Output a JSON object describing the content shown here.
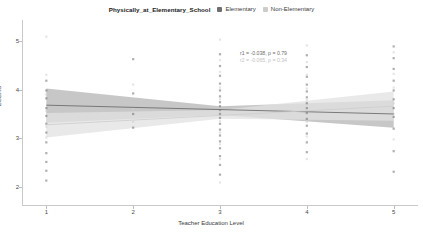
{
  "legend": {
    "title": "Physically_at_Elementary_School",
    "entries": [
      {
        "label": "Elementary",
        "color": "#6e6e6e",
        "marker": "square"
      },
      {
        "label": "Non-Elementary",
        "color": "#cccccc",
        "marker": "square"
      }
    ]
  },
  "annotations": {
    "elementary": "r1 = -0.038, p = 0.79",
    "non_elementary": "r2 = -0.065, p = 0.34"
  },
  "chart_data": {
    "type": "scatter",
    "title": "Physically_at_Elementary_School",
    "xlabel": "Teacher Education Level",
    "ylabel": "ECERS",
    "xlim": [
      0.72,
      5.28
    ],
    "ylim": [
      1.62,
      5.42
    ],
    "xticks": [
      1,
      2,
      3,
      4,
      5
    ],
    "xtick_labels": [
      "1",
      "2",
      "3",
      "4",
      "5"
    ],
    "yticks": [
      2,
      3,
      4,
      5
    ],
    "ytick_labels": [
      "2",
      "3",
      "4",
      "5"
    ],
    "grid": false,
    "legend_position": "top-center",
    "series": [
      {
        "name": "Elementary",
        "color": "#6e6e6e",
        "band_color": "#b4b4b4",
        "r": -0.038,
        "p": 0.79,
        "fit_line": {
          "x": [
            1,
            5
          ],
          "y": [
            3.68,
            3.5
          ]
        },
        "band": {
          "x": [
            1,
            3,
            5
          ],
          "upper": [
            4.02,
            3.66,
            3.78
          ],
          "lower": [
            3.32,
            3.48,
            3.22
          ]
        },
        "points": [
          {
            "x": 1,
            "y": 4.18
          },
          {
            "x": 1,
            "y": 3.98
          },
          {
            "x": 1,
            "y": 3.82
          },
          {
            "x": 1,
            "y": 3.62
          },
          {
            "x": 1,
            "y": 3.46
          },
          {
            "x": 1,
            "y": 3.3
          },
          {
            "x": 1,
            "y": 3.12
          },
          {
            "x": 1,
            "y": 2.92
          },
          {
            "x": 1,
            "y": 2.7
          },
          {
            "x": 1,
            "y": 2.52
          },
          {
            "x": 1,
            "y": 2.34
          },
          {
            "x": 1,
            "y": 2.14
          },
          {
            "x": 2,
            "y": 4.62
          },
          {
            "x": 2,
            "y": 3.92
          },
          {
            "x": 2,
            "y": 3.5
          },
          {
            "x": 2,
            "y": 3.22
          },
          {
            "x": 3,
            "y": 4.72
          },
          {
            "x": 3,
            "y": 4.48
          },
          {
            "x": 3,
            "y": 4.28
          },
          {
            "x": 3,
            "y": 4.12
          },
          {
            "x": 3,
            "y": 3.98
          },
          {
            "x": 3,
            "y": 3.86
          },
          {
            "x": 3,
            "y": 3.74
          },
          {
            "x": 3,
            "y": 3.66
          },
          {
            "x": 3,
            "y": 3.58
          },
          {
            "x": 3,
            "y": 3.5
          },
          {
            "x": 3,
            "y": 3.42
          },
          {
            "x": 3,
            "y": 3.3
          },
          {
            "x": 3,
            "y": 3.18
          },
          {
            "x": 3,
            "y": 3.06
          },
          {
            "x": 3,
            "y": 2.94
          },
          {
            "x": 3,
            "y": 2.8
          },
          {
            "x": 3,
            "y": 2.64
          },
          {
            "x": 3,
            "y": 2.46
          },
          {
            "x": 3,
            "y": 2.26
          },
          {
            "x": 4,
            "y": 4.7
          },
          {
            "x": 4,
            "y": 4.46
          },
          {
            "x": 4,
            "y": 4.26
          },
          {
            "x": 4,
            "y": 4.1
          },
          {
            "x": 4,
            "y": 3.96
          },
          {
            "x": 4,
            "y": 3.84
          },
          {
            "x": 4,
            "y": 3.72
          },
          {
            "x": 4,
            "y": 3.62
          },
          {
            "x": 4,
            "y": 3.52
          },
          {
            "x": 4,
            "y": 3.4
          },
          {
            "x": 4,
            "y": 3.26
          },
          {
            "x": 4,
            "y": 3.1
          },
          {
            "x": 4,
            "y": 2.92
          },
          {
            "x": 4,
            "y": 2.72
          },
          {
            "x": 5,
            "y": 4.88
          },
          {
            "x": 5,
            "y": 4.64
          },
          {
            "x": 5,
            "y": 4.42
          },
          {
            "x": 5,
            "y": 4.18
          },
          {
            "x": 5,
            "y": 3.98
          },
          {
            "x": 5,
            "y": 3.8
          },
          {
            "x": 5,
            "y": 3.62
          },
          {
            "x": 5,
            "y": 3.44
          },
          {
            "x": 5,
            "y": 3.2
          },
          {
            "x": 5,
            "y": 2.74
          },
          {
            "x": 5,
            "y": 2.32
          }
        ]
      },
      {
        "name": "Non-Elementary",
        "color": "#cfcfcf",
        "band_color": "#e2e2e2",
        "r": -0.065,
        "p": 0.34,
        "fit_line": {
          "x": [
            1,
            5
          ],
          "y": [
            3.28,
            3.66
          ]
        },
        "band": {
          "x": [
            1,
            3,
            5
          ],
          "upper": [
            3.52,
            3.58,
            3.96
          ],
          "lower": [
            3.02,
            3.4,
            3.36
          ]
        },
        "points": [
          {
            "x": 1,
            "y": 5.08
          },
          {
            "x": 1,
            "y": 4.3
          },
          {
            "x": 1,
            "y": 3.9
          },
          {
            "x": 1,
            "y": 3.56
          },
          {
            "x": 1,
            "y": 3.24
          },
          {
            "x": 1,
            "y": 3.02
          },
          {
            "x": 2,
            "y": 4.1
          },
          {
            "x": 2,
            "y": 3.6
          },
          {
            "x": 2,
            "y": 3.34
          },
          {
            "x": 3,
            "y": 5.02
          },
          {
            "x": 3,
            "y": 4.6
          },
          {
            "x": 3,
            "y": 4.36
          },
          {
            "x": 3,
            "y": 4.04
          },
          {
            "x": 3,
            "y": 3.8
          },
          {
            "x": 3,
            "y": 3.6
          },
          {
            "x": 3,
            "y": 3.36
          },
          {
            "x": 3,
            "y": 3.12
          },
          {
            "x": 3,
            "y": 2.88
          },
          {
            "x": 3,
            "y": 2.58
          },
          {
            "x": 3,
            "y": 2.1
          },
          {
            "x": 4,
            "y": 4.9
          },
          {
            "x": 4,
            "y": 4.56
          },
          {
            "x": 4,
            "y": 4.3
          },
          {
            "x": 4,
            "y": 4.02
          },
          {
            "x": 4,
            "y": 3.78
          },
          {
            "x": 4,
            "y": 3.56
          },
          {
            "x": 4,
            "y": 3.34
          },
          {
            "x": 4,
            "y": 3.04
          },
          {
            "x": 4,
            "y": 2.58
          },
          {
            "x": 5,
            "y": 4.76
          },
          {
            "x": 5,
            "y": 4.32
          },
          {
            "x": 5,
            "y": 4.04
          },
          {
            "x": 5,
            "y": 3.72
          },
          {
            "x": 5,
            "y": 3.5
          },
          {
            "x": 5,
            "y": 2.98
          }
        ]
      }
    ]
  }
}
